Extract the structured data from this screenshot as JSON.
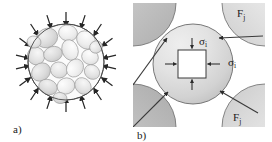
{
  "figure": {
    "background_color": "#ffffff",
    "ink_color": "#1a1a1a",
    "width": 272,
    "height": 142,
    "panels": [
      {
        "id": "panel-a",
        "caption": "a)",
        "caption_x": 13,
        "caption_y": 133,
        "description": "Spherical agglomerate of irregular primary grains under uniform inward radial compressive load"
      },
      {
        "id": "panel-b",
        "caption": "b)",
        "caption_x": 137,
        "caption_y": 137,
        "description": "Single spherical particle in contact with four neighbouring particles, internal stress element shown"
      }
    ],
    "labels": {
      "force_symbol": "F",
      "force_subscript": "j",
      "stress_symbol": "σ",
      "stress_subscript": "i"
    },
    "annotations": [
      {
        "name": "force-label-top-right",
        "symbol": "F",
        "sub": "j",
        "x": 237,
        "y": 17
      },
      {
        "name": "force-label-bottom-right",
        "symbol": "F",
        "sub": "j",
        "x": 233,
        "y": 121
      },
      {
        "name": "stress-label-vertical",
        "symbol": "σ",
        "sub": "i",
        "x": 199,
        "y": 45
      },
      {
        "name": "stress-label-horizontal",
        "symbol": "σ",
        "sub": "i",
        "x": 228,
        "y": 66
      }
    ],
    "colors": {
      "grain_light": "#f2f2f2",
      "grain_mid": "#e2e2e2",
      "grain_dark": "#d2d2d2",
      "agglomerate_fill": "#fafafa",
      "particle_fill_light": "#e6e6e6",
      "particle_fill_dark": "#c8c8c8",
      "neighbour_fill_light": "#eaeaea",
      "neighbour_fill_dark": "#b4b4b4",
      "outline": "#4a4a4a",
      "element_fill": "#ffffff"
    },
    "panel_a": {
      "circle_center_x": 66,
      "circle_center_y": 62,
      "circle_radius": 38,
      "arrow_count": 16,
      "grain_count": 17
    },
    "panel_b": {
      "frame_x": 133,
      "frame_y": 3,
      "frame_width": 132,
      "frame_height": 124,
      "center_particle_cx": 193,
      "center_particle_cy": 64,
      "center_particle_r": 40,
      "element_x": 178,
      "element_y": 50,
      "element_w": 28,
      "element_h": 28,
      "neighbour_count": 4,
      "contact_arrow_count": 4
    }
  }
}
